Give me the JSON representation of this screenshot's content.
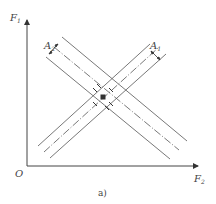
{
  "figure": {
    "caption": "a)",
    "origin_label": "O",
    "y_axis": {
      "label": "F",
      "subscript": "1"
    },
    "x_axis": {
      "label": "F",
      "subscript": "2"
    },
    "annotations": [
      {
        "label": "A",
        "subscript": "2",
        "position": "upper-left"
      },
      {
        "label": "A",
        "subscript": "1",
        "position": "upper-right"
      }
    ],
    "line_color": "#555555",
    "band_descending": {
      "lines": 3,
      "center_style": "dash-dot"
    },
    "band_ascending": {
      "lines": 3,
      "center_style": "dash-dot"
    }
  }
}
